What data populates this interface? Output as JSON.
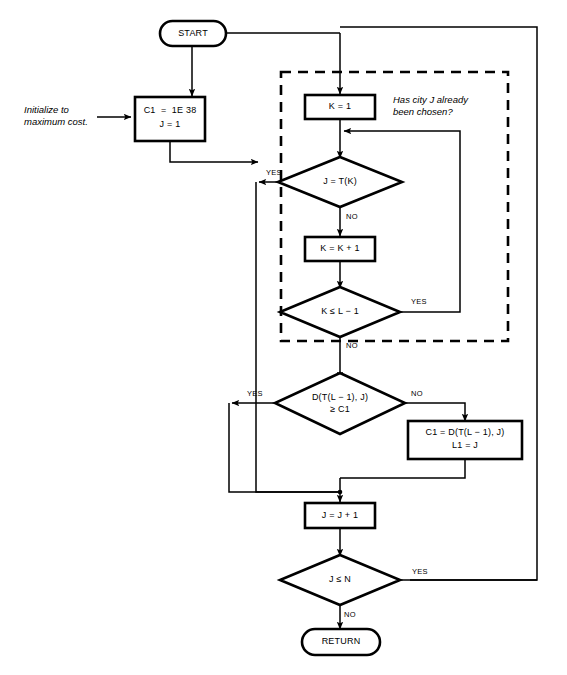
{
  "figure": {
    "caption": ""
  },
  "nodes": {
    "start": {
      "label": "START",
      "shape": "terminator"
    },
    "init": {
      "line1": "C1  =  1E 38",
      "line2": "J = 1",
      "shape": "process"
    },
    "k_init": {
      "label": "K = 1",
      "shape": "process"
    },
    "j_eq_tk": {
      "label": "J = T(K)",
      "shape": "decision"
    },
    "k_incr": {
      "label": "K = K + 1",
      "shape": "process"
    },
    "k_le_l1": {
      "label": "K ≤ L − 1",
      "shape": "decision"
    },
    "dist_test": {
      "line1": "D(T(L − 1), J)",
      "line2": "≥ C1",
      "shape": "decision"
    },
    "update": {
      "line1": "C1 = D(T(L − 1), J)",
      "line2": "L1 = J",
      "shape": "process"
    },
    "j_incr": {
      "label": "J = J + 1",
      "shape": "process"
    },
    "j_le_n": {
      "label": "J ≤ N",
      "shape": "decision"
    },
    "return": {
      "label": "RETURN",
      "shape": "terminator"
    }
  },
  "annotations": {
    "init_note": "Initialize to\nmaximum cost.",
    "chosen_note": "Has city J already\nbeen chosen?"
  },
  "edge_labels": {
    "yes": "YES",
    "no": "NO",
    "j_eq_tk_yes": "YES",
    "j_eq_tk_no": "NO",
    "k_le_l1_yes": "YES",
    "k_le_l1_no": "NO",
    "dist_yes": "YES",
    "dist_no": "NO",
    "j_le_n_yes": "YES",
    "j_le_n_no": "NO"
  },
  "colors": {
    "stroke": "#000000",
    "background": "#ffffff",
    "thin_stroke": "#1a1a1a"
  }
}
